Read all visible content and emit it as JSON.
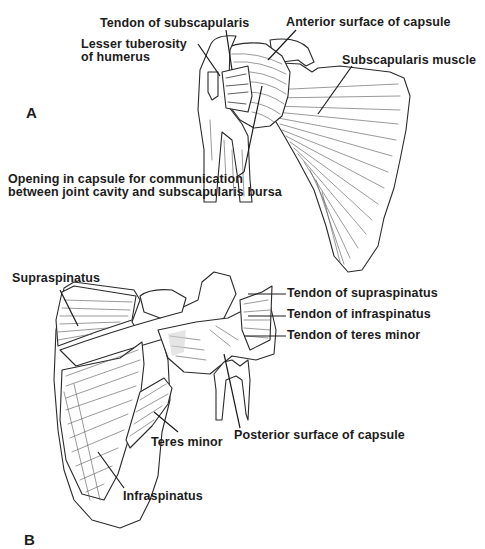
{
  "figure": {
    "panels": [
      {
        "id": "A",
        "label": "A",
        "view": "anterior",
        "annotations": [
          {
            "key": "tendon_subscapularis",
            "text": "Tendon of subscapularis"
          },
          {
            "key": "anterior_surface_capsule",
            "text": "Anterior surface of capsule"
          },
          {
            "key": "lesser_tuberosity_1",
            "text": "Lesser tuberosity"
          },
          {
            "key": "lesser_tuberosity_2",
            "text": "of humerus"
          },
          {
            "key": "subscapularis_muscle",
            "text": "Subscapularis muscle"
          },
          {
            "key": "opening_1",
            "text": "Opening in capsule for communication"
          },
          {
            "key": "opening_2",
            "text": "between joint cavity and subscapularis bursa"
          }
        ]
      },
      {
        "id": "B",
        "label": "B",
        "view": "posterior",
        "annotations": [
          {
            "key": "supraspinatus",
            "text": "Supraspinatus"
          },
          {
            "key": "tendon_supraspinatus",
            "text": "Tendon of supraspinatus"
          },
          {
            "key": "tendon_infraspinatus",
            "text": "Tendon of infraspinatus"
          },
          {
            "key": "tendon_teres_minor",
            "text": "Tendon of teres minor"
          },
          {
            "key": "teres_minor",
            "text": "Teres minor"
          },
          {
            "key": "posterior_surface_capsule",
            "text": "Posterior surface of capsule"
          },
          {
            "key": "infraspinatus",
            "text": "Infraspinatus"
          }
        ]
      }
    ],
    "colors": {
      "background": "#ffffff",
      "ink": "#1c1c1c"
    }
  }
}
